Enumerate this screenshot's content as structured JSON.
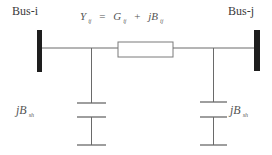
{
  "diagram": {
    "type": "pi-equivalent transmission line model",
    "bus_left": {
      "label": "Bus-i"
    },
    "bus_right": {
      "label": "Bus-j"
    },
    "series_admittance": {
      "lhs": "Y",
      "lhs_sub": "ij",
      "eq": "=",
      "g": "G",
      "g_sub": "ij",
      "op": "+",
      "b": "jB",
      "b_sub": "ij"
    },
    "shunt_left": {
      "label": "jB",
      "sub": "sh"
    },
    "shunt_right": {
      "label": "jB",
      "sub": "sh"
    },
    "colors": {
      "line": "#6a6a6a",
      "bus_bar": "#1e1e1e",
      "text": "#3a3a3a"
    }
  }
}
